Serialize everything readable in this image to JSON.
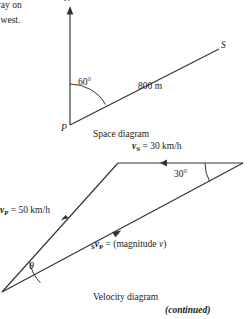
{
  "body_text": {
    "line1": "way on",
    "line2": "e west."
  },
  "space_diagram": {
    "caption": "Space diagram",
    "north_label": "N",
    "origin_label": "P",
    "ship_label": "S",
    "angle_label": "60°",
    "distance_label": "800 m",
    "line_color": "#333333"
  },
  "velocity_diagram": {
    "caption": "Velocity diagram",
    "vs_prefix": "v",
    "vs_sub": "S",
    "vs_value": " = 30 km/h",
    "vp_prefix": "v",
    "vp_sub": "P",
    "vp_value": " = 50 km/h",
    "svp_pre_sub": "S",
    "svp_prefix": "v",
    "svp_sub": "P",
    "svp_value": " = (magnitude ",
    "svp_italic_v": "v",
    "svp_close": ")",
    "angle_label": "30°",
    "theta_label": "θ",
    "line_color": "#333333"
  },
  "footer": {
    "continued": "(continued)"
  }
}
